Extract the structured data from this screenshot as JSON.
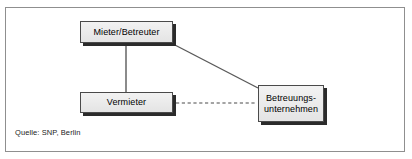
{
  "figure": {
    "type": "relationship-diagram",
    "frame": {
      "border_color": "#8f8f8f",
      "background": "#ffffff"
    },
    "caption": "Quelle: SNP, Berlin"
  },
  "nodes": [
    {
      "id": "mieter",
      "label": "Mieter/Betreuter",
      "x": 80,
      "y": 21,
      "w": 93,
      "h": 22,
      "fill": "#e9e9e9",
      "border": "#4a4a4a",
      "shadow": "#2b2b2b"
    },
    {
      "id": "vermieter",
      "label": "Vermieter",
      "x": 80,
      "y": 92,
      "w": 93,
      "h": 21,
      "fill": "#e9e9e9",
      "border": "#4a4a4a",
      "shadow": "#2b2b2b"
    },
    {
      "id": "betreuungsunternehmen",
      "label": "Betreuungs-\nunternehmen",
      "x": 258,
      "y": 85,
      "w": 66,
      "h": 37,
      "fill": "#e9e9e9",
      "border": "#4a4a4a",
      "shadow": "#2b2b2b"
    }
  ],
  "edges": [
    {
      "id": "mieter-vermieter",
      "from": "mieter",
      "to": "vermieter",
      "style": "solid",
      "color": "#5a5a5a",
      "x1": 126,
      "y1": 44,
      "x2": 126,
      "y2": 92
    },
    {
      "id": "mieter-betreuungsunternehmen",
      "from": "mieter",
      "to": "betreuungsunternehmen",
      "style": "solid",
      "color": "#5a5a5a",
      "x1": 173,
      "y1": 44,
      "x2": 258,
      "y2": 88
    },
    {
      "id": "vermieter-betreuungsunternehmen",
      "from": "vermieter",
      "to": "betreuungsunternehmen",
      "style": "dashed",
      "color": "#4a4a4a",
      "x1": 176,
      "y1": 103,
      "x2": 256,
      "y2": 103
    }
  ]
}
